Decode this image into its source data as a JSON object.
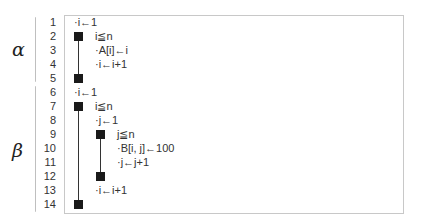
{
  "blocks": [
    {
      "label": "α",
      "lines_from": 1,
      "lines_to": 5
    },
    {
      "label": "β",
      "lines_from": 6,
      "lines_to": 14
    }
  ],
  "line_numbers": [
    "1",
    "2",
    "3",
    "4",
    "5",
    "6",
    "7",
    "8",
    "9",
    "10",
    "11",
    "12",
    "13",
    "14"
  ],
  "lines": {
    "l1": "·i←1",
    "l2": "i≦n",
    "l3": "·A[i]←i",
    "l4": "·i←i+1",
    "l6": "·i←1",
    "l7": "i≦n",
    "l8": "·j←1",
    "l9": "j≦n",
    "l10": "·B[i, j]←100",
    "l11": "·j←j+1",
    "l13": "·i←i+1"
  }
}
